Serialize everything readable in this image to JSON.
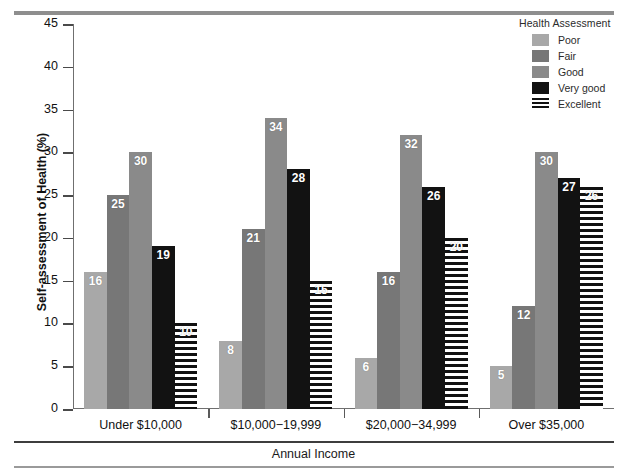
{
  "chart_data": {
    "type": "bar",
    "title": "",
    "xlabel": "Annual Income",
    "ylabel": "Self-assessment of Health (%)",
    "ylim": [
      0,
      45
    ],
    "ytick_values": [
      0,
      5,
      10,
      15,
      20,
      25,
      30,
      35,
      40,
      45
    ],
    "ytick_labels": [
      "0",
      "5",
      "10",
      "15",
      "20",
      "25",
      "30",
      "35",
      "40",
      "45"
    ],
    "grid": false,
    "legend_position": "top-right",
    "legend_title": "Health Assessment",
    "categories": [
      "Under $10,000",
      "$10,000−19,999",
      "$20,000−34,999",
      "Over $35,000"
    ],
    "series": [
      {
        "name": "Poor",
        "color": "#a8a8a8",
        "pattern": "solid",
        "values": [
          16,
          8,
          6,
          5
        ]
      },
      {
        "name": "Fair",
        "color": "#777777",
        "pattern": "solid",
        "values": [
          25,
          21,
          16,
          12
        ]
      },
      {
        "name": "Good",
        "color": "#8a8a8a",
        "pattern": "solid",
        "values": [
          30,
          34,
          32,
          30
        ]
      },
      {
        "name": "Very good",
        "color": "#121212",
        "pattern": "solid",
        "values": [
          19,
          28,
          26,
          27
        ]
      },
      {
        "name": "Excellent",
        "color": "#111111",
        "pattern": "horizontal-stripes",
        "values": [
          10,
          15,
          20,
          26
        ]
      }
    ]
  },
  "legend": {
    "title": "Health Assessment",
    "items": [
      {
        "label": "Poor",
        "swatch": "fill-poor"
      },
      {
        "label": "Fair",
        "swatch": "fill-fair"
      },
      {
        "label": "Good",
        "swatch": "fill-good"
      },
      {
        "label": "Very good",
        "swatch": "fill-verygood"
      },
      {
        "label": "Excellent",
        "swatch": "fill-excellent"
      }
    ]
  },
  "axes": {
    "y_title": "Self-assessment of Health (%)",
    "x_title": "Annual Income"
  }
}
